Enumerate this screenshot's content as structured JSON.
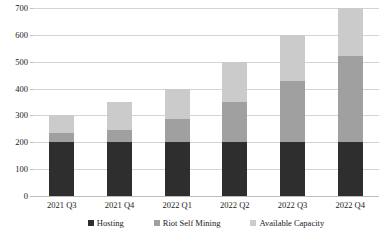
{
  "chart_data": {
    "type": "bar",
    "stacked": true,
    "title": "",
    "subtitle": "",
    "xlabel": "",
    "ylabel": "",
    "ylim": [
      0,
      700
    ],
    "ytick_step": 100,
    "ytick_labels": [
      "0",
      "100",
      "200",
      "300",
      "400",
      "500",
      "600",
      "700"
    ],
    "ytick_values": [
      0,
      100,
      200,
      300,
      400,
      500,
      600,
      700
    ],
    "grid": "horizontal",
    "legend_position": "bottom",
    "categories": [
      "2021 Q3",
      "2021 Q4",
      "2022 Q1",
      "2022 Q2",
      "2022 Q3",
      "2022 Q4"
    ],
    "series": [
      {
        "name": "Hosting",
        "color": "#2e2e2e",
        "values": [
          200,
          200,
          200,
          200,
          200,
          200
        ]
      },
      {
        "name": "Riot Self Mining",
        "color": "#a0a0a0",
        "values": [
          33,
          45,
          85,
          150,
          230,
          320
        ]
      },
      {
        "name": "Available Capacity",
        "color": "#cbcbcb",
        "values": [
          67,
          105,
          115,
          150,
          170,
          180
        ]
      }
    ],
    "totals": [
      300,
      350,
      400,
      500,
      600,
      700
    ]
  },
  "legend": {
    "items": [
      {
        "label": "Hosting",
        "color": "#2e2e2e"
      },
      {
        "label": "Riot Self Mining",
        "color": "#a0a0a0"
      },
      {
        "label": "Available Capacity",
        "color": "#cbcbcb"
      }
    ]
  },
  "colors": {
    "hosting": "#2e2e2e",
    "riot_self_mining": "#a0a0a0",
    "available_capacity": "#cbcbcb",
    "gridline": "#d4d4d4",
    "axis": "#bdbdbd",
    "text": "#1a1a1a",
    "background": "#ffffff"
  }
}
